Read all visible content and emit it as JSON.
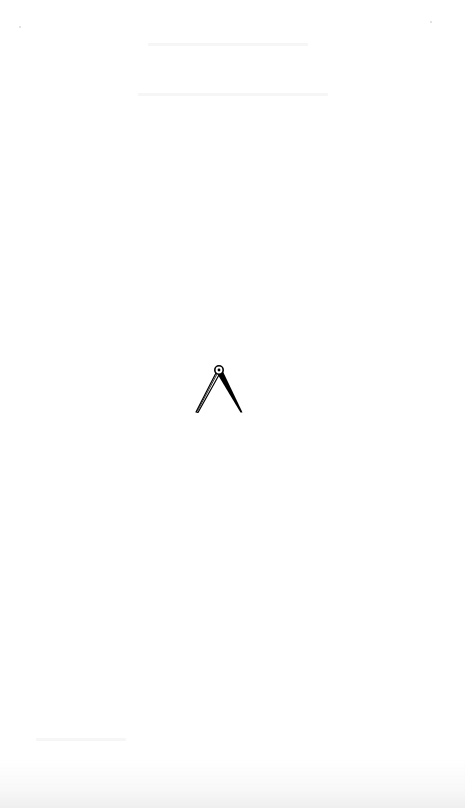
{
  "page": {
    "type": "blank book page",
    "background_color": "#ffffff",
    "ornament": {
      "icon": "drafting-compass-icon",
      "description": "drafting compass / dividers vignette",
      "color": "#000000"
    }
  }
}
